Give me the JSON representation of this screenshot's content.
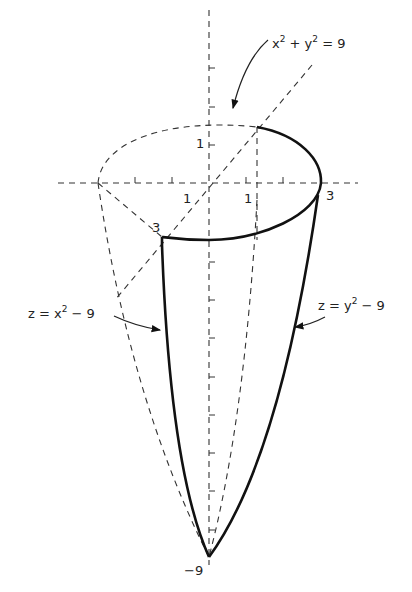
{
  "figure": {
    "labels": {
      "circle_eq": {
        "base1": "x",
        "exp1": "2",
        "mid": " + ",
        "base2": "y",
        "exp2": "2",
        "tail": " = 9"
      },
      "left_eq": {
        "pre": "z = x",
        "exp": "2",
        "tail": " − 9"
      },
      "right_eq": {
        "pre": "z = y",
        "exp": "2",
        "tail": " − 9"
      },
      "y_one": "1",
      "x_one_left": "1",
      "x_one_right": "1",
      "x_three": "3",
      "y_three": "3",
      "z_min": "−9"
    },
    "colors": {
      "ink": "#111111",
      "background": "#ffffff"
    }
  }
}
